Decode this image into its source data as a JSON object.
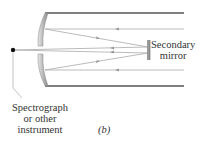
{
  "diagram": {
    "type": "telescope optics (Cassegrain-style) schematic",
    "figure_label": "(b)",
    "labels": {
      "secondary_mirror": [
        "Secondary",
        "mirror"
      ],
      "instrument": [
        "Spectrograph",
        "or other",
        "instrument"
      ]
    },
    "colors": {
      "tube": "#555555",
      "rays": "#a8a8a8",
      "mirror": "#9a9a9a",
      "focus_dot": "#111111",
      "text": "#333333"
    }
  }
}
